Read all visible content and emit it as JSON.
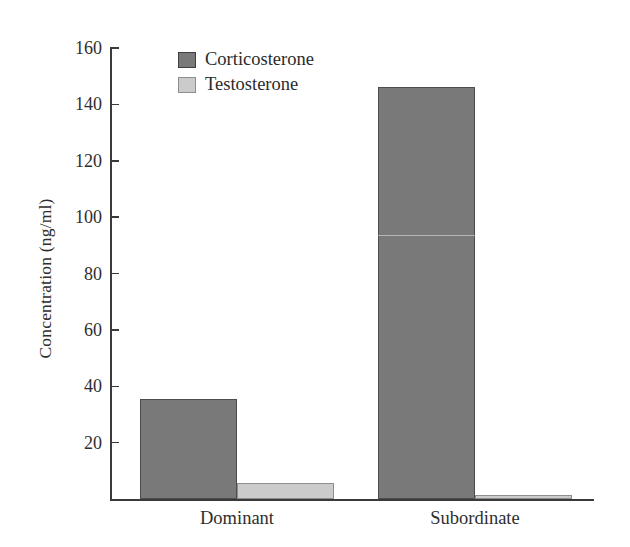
{
  "chart_data": {
    "type": "bar",
    "title": "",
    "subtitle": "",
    "xlabel": "",
    "ylabel": "Concentration (ng/ml)",
    "categories": [
      "Dominant",
      "Subordinate"
    ],
    "series": [
      {
        "name": "Corticosterone",
        "color": "#797979",
        "values": [
          35.5,
          146.0
        ]
      },
      {
        "name": "Testosterone",
        "color": "#cbcbcb",
        "values": [
          5.7,
          1.5
        ]
      }
    ],
    "ylim": [
      0,
      160
    ],
    "yticks": [
      0,
      20,
      40,
      60,
      80,
      100,
      120,
      140,
      160
    ],
    "ytick_labels": [
      "",
      "20",
      "40",
      "60",
      "80",
      "100",
      "120",
      "140",
      "160"
    ],
    "grid": false,
    "legend_position": "top-left-inside",
    "bar_grouping": "grouped-adjacent"
  },
  "axes": {
    "y_title": "Concentration (ng/ml)",
    "tick_labels": [
      "160",
      "140",
      "120",
      "100",
      "80",
      "60",
      "40",
      "20"
    ],
    "tick_values": [
      160,
      140,
      120,
      100,
      80,
      60,
      40,
      20
    ]
  },
  "legend": {
    "items": [
      {
        "label": "Corticosterone",
        "swatch": "dark-gray"
      },
      {
        "label": "Testosterone",
        "swatch": "light-gray"
      }
    ]
  },
  "categories": [
    {
      "label": "Dominant"
    },
    {
      "label": "Subordinate"
    }
  ]
}
